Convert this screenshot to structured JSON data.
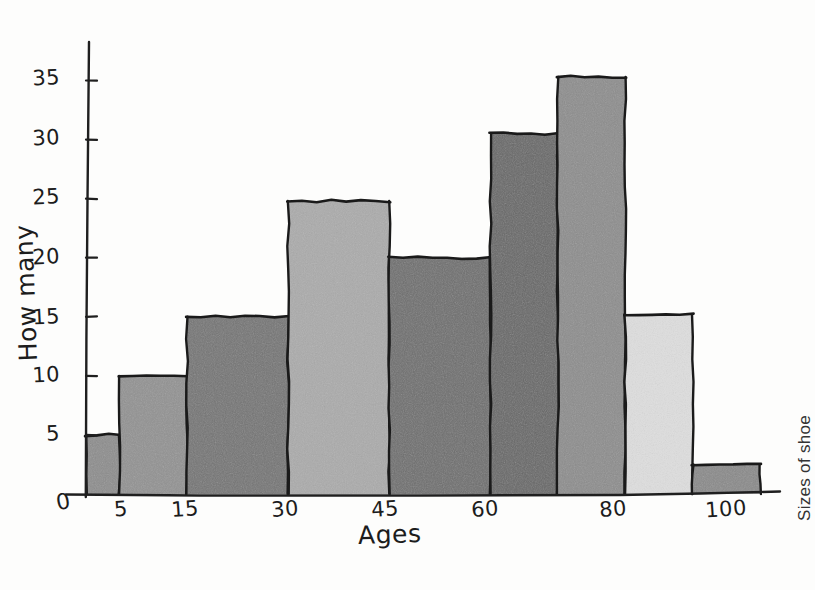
{
  "chart_data": {
    "type": "bar",
    "style": "hand-drawn histogram on white paper",
    "title": "",
    "xlabel": "Ages",
    "ylabel": "How many",
    "right_label": "Sizes of shoe",
    "grid": false,
    "legend": null,
    "xlim": [
      0,
      100
    ],
    "ylim": [
      0,
      37
    ],
    "x_ticks": [
      "0",
      "5",
      "15",
      "30",
      "45",
      "60",
      "80",
      "100"
    ],
    "x_tick_values": [
      0,
      5,
      15,
      30,
      45,
      60,
      80,
      100
    ],
    "y_ticks": [
      "5",
      "10",
      "15",
      "20",
      "25",
      "30",
      "35"
    ],
    "y_tick_values": [
      5,
      10,
      15,
      20,
      25,
      30,
      35
    ],
    "origin_label": "0",
    "bin_edges": [
      0,
      5,
      15,
      30,
      45,
      60,
      70,
      80,
      90,
      100
    ],
    "categories": [
      "0-5",
      "5-15",
      "15-30",
      "30-45",
      "45-60",
      "60-70",
      "70-80",
      "80-90",
      "90-100"
    ],
    "values": [
      5,
      10,
      15,
      24.8,
      20,
      30.5,
      35.3,
      15.2,
      2.5
    ],
    "bar_colors": [
      "#8d8d8d",
      "#929292",
      "#757575",
      "#ababab",
      "#6f6f6f",
      "#686868",
      "#8d8d8d",
      "#dedede",
      "#8a8a8a"
    ],
    "bar_outline_color": "#1a1a1a",
    "axis_color": "#1f1f1f",
    "background_color": "#fdfdfc"
  }
}
